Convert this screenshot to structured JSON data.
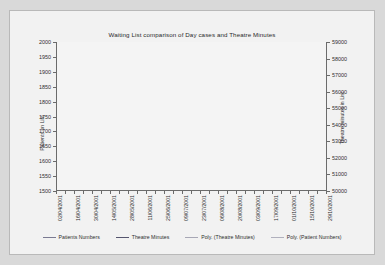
{
  "chart_data": {
    "type": "line",
    "title": "Waiting List comparison of Day cases and Theatre Minutes",
    "xlabel": "",
    "ylabel": "Patients on List",
    "y2label": "Theatre minutes in List",
    "ylim": [
      1500,
      2000
    ],
    "y2lim": [
      50000,
      59000
    ],
    "yticks": [
      1500,
      1550,
      1600,
      1650,
      1700,
      1750,
      1800,
      1850,
      1900,
      1950,
      2000
    ],
    "y2ticks": [
      50000,
      51000,
      52000,
      53000,
      54000,
      55000,
      56000,
      57000,
      58000,
      59000
    ],
    "grid": false,
    "legend_position": "bottom",
    "x": [
      "02/04/2001",
      "09/04/2001",
      "16/04/2001",
      "23/04/2001",
      "30/04/2001",
      "07/05/2001",
      "14/05/2001",
      "21/05/2001",
      "28/05/2001",
      "04/06/2001",
      "11/06/2001",
      "18/06/2001",
      "25/06/2001",
      "02/07/2001",
      "09/07/2001",
      "16/07/2001",
      "23/07/2001",
      "30/07/2001",
      "06/08/2001",
      "13/08/2001",
      "20/08/2001",
      "27/08/2001",
      "03/09/2001",
      "10/09/2001",
      "17/09/2001",
      "24/09/2001",
      "01/10/2001",
      "08/10/2001",
      "15/10/2001",
      "22/10/2001",
      "29/10/2001"
    ],
    "xtick_labels": [
      "02/04/2001",
      "16/04/2001",
      "30/04/2001",
      "14/05/2001",
      "28/05/2001",
      "11/06/2001",
      "25/06/2001",
      "09/07/2001",
      "23/07/2001",
      "06/08/2001",
      "20/08/2001",
      "03/09/2001",
      "17/09/2001",
      "01/10/2001",
      "15/10/2001",
      "29/10/2001"
    ],
    "series": [
      {
        "name": "Patients Numbers",
        "axis": "left",
        "color": "#7a7a92",
        "values": [
          1915,
          1912,
          1895,
          1958,
          1868,
          1875,
          1892,
          1830,
          1872,
          1879,
          1897,
          1800,
          1658,
          1745,
          1737,
          1770,
          1657,
          1700,
          1713,
          1690,
          1747,
          1729,
          1737,
          1691,
          1735,
          1741,
          1745,
          1702,
          1706,
          1726,
          1742
        ]
      },
      {
        "name": "Theatre Minutes",
        "axis": "right",
        "color": "#55556e",
        "values": [
          57300,
          57350,
          57200,
          57600,
          57150,
          57450,
          57500,
          57450,
          57600,
          57800,
          57450,
          55600,
          55400,
          55500,
          55450,
          55300,
          54100,
          54400,
          54000,
          55000,
          55500,
          55800,
          55900,
          55200,
          57000,
          57100,
          55000,
          54800,
          55500,
          56000,
          57300
        ]
      }
    ],
    "trendlines": [
      {
        "name": "Poly. (Theatre Minutes)",
        "axis": "right",
        "color": "#a7a7b5",
        "type": "polynomial"
      },
      {
        "name": "Poly. (Patient Numbers)",
        "axis": "left",
        "color": "#b0b0bd",
        "type": "polynomial"
      }
    ],
    "legend": [
      {
        "label": "Patients Numbers",
        "color": "#7a7a92"
      },
      {
        "label": "Theatre Minutes",
        "color": "#55556e"
      },
      {
        "label": "Poly. (Theatre Minutes)",
        "color": "#a7a7b5"
      },
      {
        "label": "Poly. (Patient Numbers)",
        "color": "#b0b0bd"
      }
    ]
  }
}
